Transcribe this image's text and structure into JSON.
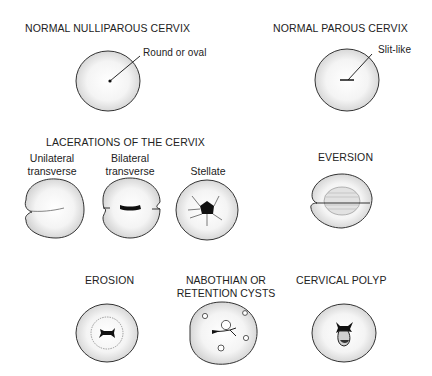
{
  "figure": {
    "panels": [
      {
        "id": "nulliparous",
        "title": "NORMAL NULLIPAROUS CERVIX",
        "callout": "Round or oval"
      },
      {
        "id": "parous",
        "title": "NORMAL PAROUS CERVIX",
        "callout": "Slit-like"
      },
      {
        "id": "lacerations",
        "title": "LACERATIONS OF THE CERVIX",
        "subtypes": [
          {
            "line1": "Unilateral",
            "line2": "transverse"
          },
          {
            "line1": "Bilateral",
            "line2": "transverse"
          },
          {
            "line1": "Stellate",
            "line2": ""
          }
        ]
      },
      {
        "id": "eversion",
        "title": "EVERSION"
      },
      {
        "id": "erosion",
        "title": "EROSION"
      },
      {
        "id": "nabothian",
        "title_line1": "NABOTHIAN OR",
        "title_line2": "RETENTION CYSTS"
      },
      {
        "id": "polyp",
        "title": "CERVICAL POLYP"
      }
    ]
  }
}
